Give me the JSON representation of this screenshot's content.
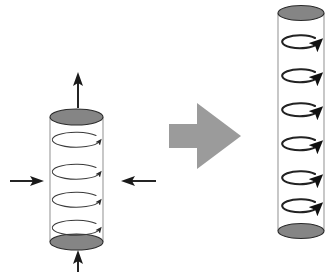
{
  "figure": {
    "title": "Cylinder rotation transformation diagram",
    "background_color": "#ffffff",
    "width": 328,
    "height": 272
  },
  "palette": {
    "cap_fill": "#858585",
    "cap_stroke": "#2a2a2a",
    "side_stroke": "#9a9a9a",
    "arrow_stroke": "#1a1a1a",
    "block_arrow_fill": "#9b9b9b",
    "rotation_thin": "#3a3a3a",
    "rotation_bold": "#222222"
  },
  "left_cylinder": {
    "name": "source-cylinder",
    "cx": 76.5,
    "rx": 26.5,
    "ry": 8.0,
    "top_cy": 117,
    "bottom_cy": 242,
    "rotation_arrow_count": 4,
    "rotation_arrow_cys": [
      140,
      172,
      200,
      228
    ],
    "rotation_arrow_rx": 24,
    "rotation_arrow_ry": 7.5,
    "rotation_style": "thin",
    "rotation_direction": "counter-clockwise-top-view"
  },
  "right_cylinder": {
    "name": "result-cylinder",
    "cx": 301,
    "rx": 23,
    "ry": 7.5,
    "top_cy": 13,
    "bottom_cy": 231,
    "rotation_arrow_count": 6,
    "rotation_arrow_cys": [
      42,
      76,
      110,
      144,
      178,
      206
    ],
    "rotation_arrow_rx": 18,
    "rotation_arrow_ry": 6.5,
    "rotation_style": "bold",
    "rotation_direction": "counter-clockwise-top-view"
  },
  "load_arrows": [
    {
      "name": "top-axial-load-arrow",
      "direction": "up",
      "x1": 78,
      "y1": 108,
      "x2": 78,
      "y2": 74,
      "head_size": 5.5
    },
    {
      "name": "bottom-axial-load-arrow",
      "direction": "up",
      "x1": 78,
      "y1": 272,
      "x2": 78,
      "y2": 252,
      "head_size": 5.5
    },
    {
      "name": "left-radial-load-arrow",
      "direction": "right",
      "x1": 10,
      "y1": 181,
      "x2": 44,
      "y2": 181,
      "head_size": 5.5
    },
    {
      "name": "right-radial-load-arrow",
      "direction": "left",
      "x1": 156,
      "y1": 181,
      "x2": 121,
      "y2": 181,
      "head_size": 5.5
    }
  ],
  "transform_arrow": {
    "name": "transform-block-arrow",
    "direction": "right",
    "tail_x": 169,
    "tail_y_top": 124,
    "tail_y_bottom": 148,
    "neck_x": 197,
    "head_y_top": 103,
    "head_y_bottom": 169,
    "tip_x": 241,
    "tip_y": 136,
    "fill": "#9b9b9b"
  }
}
